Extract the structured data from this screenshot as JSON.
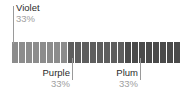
{
  "chart_data": {
    "type": "bar",
    "orientation": "horizontal-stacked-segmented",
    "title": "",
    "xlabel": "",
    "ylabel": "",
    "categories": [
      "Violet",
      "Purple",
      "Plum"
    ],
    "values": [
      33,
      33,
      33
    ],
    "value_labels": [
      "33%",
      "33%",
      "33%"
    ],
    "unit": "%",
    "grid": false,
    "legend": "none",
    "segment_count": 24,
    "segment_groups": [
      {
        "name": "Violet",
        "segments": 8,
        "color": "#8c8c8c"
      },
      {
        "name": "Purple",
        "segments": 8,
        "color": "#5e5e5e"
      },
      {
        "name": "Plum",
        "segments": 8,
        "color": "#4a4a4a"
      }
    ],
    "annotations": [
      {
        "label": "Violet",
        "percent": "33%",
        "position": "above-left"
      },
      {
        "label": "Purple",
        "percent": "33%",
        "position": "below-center"
      },
      {
        "label": "Plum",
        "percent": "33%",
        "position": "below-right"
      }
    ]
  },
  "colors": {
    "background": "#ffffff",
    "label_text": "#2b2b2b",
    "percent_text": "#a0a0a0",
    "leader_line": "#9a9a9a",
    "segment_gap": "#ffffff"
  },
  "annotations": {
    "violet": {
      "name": "Violet",
      "percent": "33%"
    },
    "purple": {
      "name": "Purple",
      "percent": "33%"
    },
    "plum": {
      "name": "Plum",
      "percent": "33%"
    }
  }
}
